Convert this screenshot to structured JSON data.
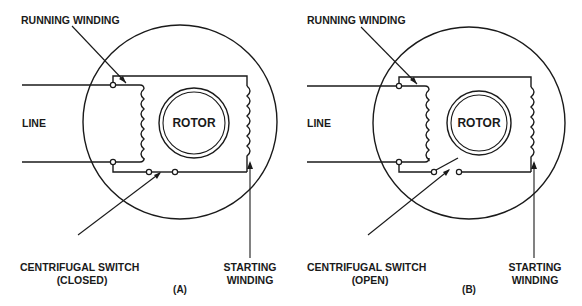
{
  "figure": {
    "panels": [
      {
        "id": "A",
        "caption": "(A)",
        "labels": {
          "running_winding": "RUNNING WINDING",
          "line": "LINE",
          "rotor": "ROTOR",
          "switch_line1": "CENTRIFUGAL SWITCH",
          "switch_line2": "(CLOSED)",
          "starting_line1": "STARTING",
          "starting_line2": "WINDING"
        },
        "switch_state": "closed"
      },
      {
        "id": "B",
        "caption": "(B)",
        "labels": {
          "running_winding": "RUNNING WINDING",
          "line": "LINE",
          "rotor": "ROTOR",
          "switch_line1": "CENTRIFUGAL SWITCH",
          "switch_line2": "(OPEN)",
          "starting_line1": "STARTING",
          "starting_line2": "WINDING"
        },
        "switch_state": "open"
      }
    ],
    "colors": {
      "ink": "#1a1a1a",
      "background": "#ffffff"
    }
  }
}
